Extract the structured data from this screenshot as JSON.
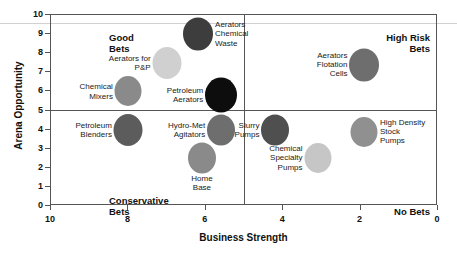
{
  "chart_data": {
    "type": "scatter",
    "title": "",
    "xlabel": "Business Strength",
    "ylabel": "Arena Opportunity",
    "xlim": [
      10,
      0
    ],
    "ylim": [
      0,
      10
    ],
    "x_reversed": true,
    "grid": false,
    "legend": "none",
    "xticks": [
      "10",
      "8",
      "6",
      "4",
      "2",
      "0"
    ],
    "xtick_values": [
      10,
      8,
      6,
      4,
      2,
      0
    ],
    "yticks": [
      "0",
      "1",
      "2",
      "3",
      "4",
      "5",
      "6",
      "7",
      "8",
      "9",
      "10"
    ],
    "ytick_values": [
      0,
      1,
      2,
      3,
      4,
      5,
      6,
      7,
      8,
      9,
      10
    ],
    "quadrant_divider_x": 5,
    "quadrant_divider_y": 5,
    "quadrants": [
      {
        "name": "good-bets",
        "label": "Good\nBets",
        "position": "top-left"
      },
      {
        "name": "high-risk-bets",
        "label": "High Risk\nBets",
        "position": "top-right"
      },
      {
        "name": "conservative-bets",
        "label": "Conservative\nBets",
        "position": "bottom-left"
      },
      {
        "name": "no-bets",
        "label": "No Bets",
        "position": "bottom-right"
      }
    ],
    "points": [
      {
        "name": "aerators-chemical-waste",
        "label": "Aerators\nChemical\nWaste",
        "x": 6.2,
        "y": 9.0,
        "size": 30,
        "color": "#3d3d3d",
        "label_side": "right"
      },
      {
        "name": "aerators-for-pp",
        "label": "Aerators for\nP&P",
        "x": 7.0,
        "y": 7.5,
        "size": 29,
        "color": "#d0d0d0",
        "label_side": "left"
      },
      {
        "name": "aerators-flotation-cells",
        "label": "Aerators\nFlotation\nCells",
        "x": 1.9,
        "y": 7.4,
        "size": 30,
        "color": "#6e6e6e",
        "label_side": "left"
      },
      {
        "name": "chemical-mixers",
        "label": "Chemical\nMixers",
        "x": 8.0,
        "y": 6.0,
        "size": 27,
        "color": "#8a8a8a",
        "label_side": "left"
      },
      {
        "name": "petroleum-aerators",
        "label": "Petroleum\nAerators",
        "x": 5.6,
        "y": 5.8,
        "size": 32,
        "color": "#0d0d0d",
        "label_side": "left"
      },
      {
        "name": "high-density-stock-pumps",
        "label": "High Density\nStock\nPumps",
        "x": 1.9,
        "y": 3.9,
        "size": 27,
        "color": "#909090",
        "label_side": "right"
      },
      {
        "name": "petroleum-blenders",
        "label": "Petroleum\nBlenders",
        "x": 8.0,
        "y": 4.0,
        "size": 29,
        "color": "#5c5c5c",
        "label_side": "left"
      },
      {
        "name": "hydro-met-agitators",
        "label": "Hydro-Met\nAgitators",
        "x": 5.6,
        "y": 4.0,
        "size": 28,
        "color": "#6e6e6e",
        "label_side": "left"
      },
      {
        "name": "slurry-pumps",
        "label": "Slurry\nPumps",
        "x": 4.2,
        "y": 4.0,
        "size": 28,
        "color": "#4f4f4f",
        "label_side": "left"
      },
      {
        "name": "home-base",
        "label": "Home\nBase",
        "x": 6.1,
        "y": 2.5,
        "size": 28,
        "color": "#8a8a8a",
        "label_side": "below"
      },
      {
        "name": "chemical-specialty-pumps",
        "label": "Chemical\nSpecialty\nPumps",
        "x": 3.1,
        "y": 2.5,
        "size": 27,
        "color": "#c6c6c6",
        "label_side": "left"
      }
    ]
  },
  "colors": {
    "axis": "#555555",
    "text": "#111111",
    "background": "#ffffff"
  }
}
